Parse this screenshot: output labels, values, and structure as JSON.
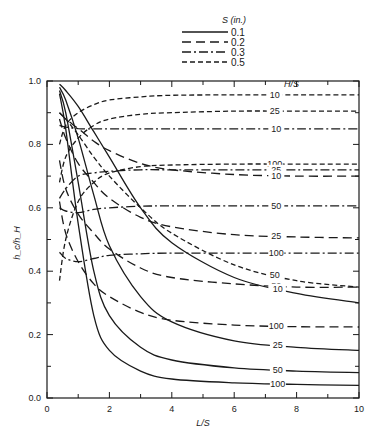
{
  "chart_data": {
    "type": "line",
    "title": "",
    "xlabel": "L/S",
    "ylabel": "h_c/h_H",
    "xlim": [
      0,
      10
    ],
    "ylim": [
      0.0,
      1.0
    ],
    "x_ticks": [
      "0",
      "2",
      "4",
      "6",
      "8",
      "10"
    ],
    "y_ticks": [
      "0.0",
      "0.2",
      "0.4",
      "0.6",
      "0.8",
      "1.0"
    ],
    "grid": false,
    "legend": {
      "title": "S (in.)",
      "position": "top-center",
      "entries": [
        {
          "label": "0.1",
          "style": "solid"
        },
        {
          "label": "0.2",
          "style": "long-dash"
        },
        {
          "label": "0.3",
          "style": "dash-dot"
        },
        {
          "label": "0.5",
          "style": "short-dash"
        }
      ]
    },
    "curve_family_label": "H/S",
    "series": [
      {
        "name": "S=0.5, H/S=10",
        "S": "0.5",
        "HS": "10",
        "style": "short-dash",
        "x": [
          0.4,
          0.6,
          1,
          1.5,
          2,
          3,
          4,
          6,
          8,
          10
        ],
        "y": [
          0.8,
          0.86,
          0.9,
          0.925,
          0.94,
          0.95,
          0.955,
          0.956,
          0.956,
          0.956
        ]
      },
      {
        "name": "S=0.5, H/S=25",
        "S": "0.5",
        "HS": "25",
        "style": "short-dash",
        "x": [
          0.4,
          0.6,
          1,
          1.5,
          2,
          3,
          4,
          6,
          8,
          10
        ],
        "y": [
          0.68,
          0.76,
          0.82,
          0.86,
          0.88,
          0.895,
          0.9,
          0.905,
          0.905,
          0.905
        ]
      },
      {
        "name": "S=0.5, H/S=50",
        "S": "0.5",
        "HS": "50",
        "style": "short-dash",
        "x": [
          0.4,
          0.6,
          1,
          1.5,
          2,
          3,
          4,
          6,
          8,
          10
        ],
        "y": [
          0.9,
          0.88,
          0.83,
          0.76,
          0.7,
          0.6,
          0.52,
          0.42,
          0.37,
          0.35
        ]
      },
      {
        "name": "S=0.5, H/S=100",
        "S": "0.5",
        "HS": "100",
        "style": "short-dash",
        "x": [
          0.4,
          0.6,
          1,
          1.5,
          2,
          3,
          4,
          6,
          8,
          10
        ],
        "y": [
          0.37,
          0.5,
          0.62,
          0.68,
          0.71,
          0.73,
          0.735,
          0.738,
          0.738,
          0.738
        ]
      },
      {
        "name": "S=0.3, H/S=10",
        "S": "0.3",
        "HS": "10",
        "style": "dash-dot",
        "x": [
          0.4,
          0.6,
          1,
          1.5,
          2,
          3,
          4,
          6,
          8,
          10
        ],
        "y": [
          0.86,
          0.855,
          0.85,
          0.849,
          0.849,
          0.849,
          0.849,
          0.849,
          0.849,
          0.849
        ]
      },
      {
        "name": "S=0.3, H/S=25",
        "S": "0.3",
        "HS": "25",
        "style": "dash-dot",
        "x": [
          0.4,
          0.6,
          1,
          1.5,
          2,
          3,
          4,
          6,
          8,
          10
        ],
        "y": [
          0.63,
          0.66,
          0.7,
          0.71,
          0.715,
          0.72,
          0.72,
          0.72,
          0.72,
          0.72
        ]
      },
      {
        "name": "S=0.3, H/S=50",
        "S": "0.3",
        "HS": "50",
        "style": "dash-dot",
        "x": [
          0.4,
          0.6,
          1,
          1.5,
          2,
          3,
          4,
          6,
          8,
          10
        ],
        "y": [
          0.6,
          0.59,
          0.585,
          0.595,
          0.6,
          0.605,
          0.606,
          0.606,
          0.606,
          0.606
        ]
      },
      {
        "name": "S=0.3, H/S=100",
        "S": "0.3",
        "HS": "100",
        "style": "dash-dot",
        "x": [
          0.4,
          0.6,
          1,
          1.5,
          2,
          3,
          4,
          6,
          8,
          10
        ],
        "y": [
          0.46,
          0.44,
          0.43,
          0.44,
          0.45,
          0.455,
          0.457,
          0.457,
          0.457,
          0.457
        ]
      },
      {
        "name": "S=0.2, H/S=10",
        "S": "0.2",
        "HS": "10",
        "style": "long-dash",
        "x": [
          0.4,
          0.6,
          1,
          1.5,
          2,
          3,
          4,
          6,
          8,
          10
        ],
        "y": [
          0.9,
          0.88,
          0.85,
          0.81,
          0.78,
          0.74,
          0.72,
          0.705,
          0.7,
          0.7
        ]
      },
      {
        "name": "S=0.2, H/S=25",
        "S": "0.2",
        "HS": "25",
        "style": "long-dash",
        "x": [
          0.4,
          0.6,
          1,
          1.5,
          2,
          3,
          4,
          6,
          8,
          10
        ],
        "y": [
          0.88,
          0.82,
          0.74,
          0.68,
          0.63,
          0.57,
          0.54,
          0.515,
          0.508,
          0.505
        ]
      },
      {
        "name": "S=0.2, H/S=50",
        "S": "0.2",
        "HS": "50",
        "style": "long-dash",
        "x": [
          0.4,
          0.6,
          1,
          1.5,
          2,
          3,
          4,
          6,
          8,
          10
        ],
        "y": [
          0.75,
          0.66,
          0.58,
          0.52,
          0.47,
          0.41,
          0.38,
          0.36,
          0.35,
          0.35
        ]
      },
      {
        "name": "S=0.2, H/S=100",
        "S": "0.2",
        "HS": "100",
        "style": "long-dash",
        "x": [
          0.4,
          0.6,
          1,
          1.5,
          2,
          3,
          4,
          6,
          8,
          10
        ],
        "y": [
          0.62,
          0.52,
          0.43,
          0.36,
          0.32,
          0.27,
          0.245,
          0.23,
          0.225,
          0.224
        ]
      },
      {
        "name": "S=0.1, H/S=10",
        "S": "0.1",
        "HS": "10",
        "style": "solid",
        "x": [
          0.4,
          0.6,
          1,
          1.5,
          2,
          3,
          4,
          6,
          8,
          10
        ],
        "y": [
          0.99,
          0.97,
          0.92,
          0.84,
          0.76,
          0.6,
          0.49,
          0.38,
          0.33,
          0.3
        ]
      },
      {
        "name": "S=0.1, H/S=25",
        "S": "0.1",
        "HS": "25",
        "style": "solid",
        "x": [
          0.4,
          0.6,
          1,
          1.5,
          2,
          3,
          4,
          6,
          8,
          10
        ],
        "y": [
          0.98,
          0.94,
          0.82,
          0.64,
          0.48,
          0.32,
          0.24,
          0.18,
          0.16,
          0.15
        ]
      },
      {
        "name": "S=0.1, H/S=50",
        "S": "0.1",
        "HS": "50",
        "style": "solid",
        "x": [
          0.4,
          0.6,
          1,
          1.5,
          2,
          3,
          4,
          6,
          8,
          10
        ],
        "y": [
          0.97,
          0.9,
          0.68,
          0.4,
          0.26,
          0.16,
          0.12,
          0.095,
          0.085,
          0.08
        ]
      },
      {
        "name": "S=0.1, H/S=100",
        "S": "0.1",
        "HS": "100",
        "style": "solid",
        "x": [
          0.4,
          0.6,
          1,
          1.5,
          2,
          3,
          4,
          6,
          8,
          10
        ],
        "y": [
          0.96,
          0.85,
          0.55,
          0.26,
          0.15,
          0.085,
          0.06,
          0.048,
          0.043,
          0.04
        ]
      }
    ]
  }
}
